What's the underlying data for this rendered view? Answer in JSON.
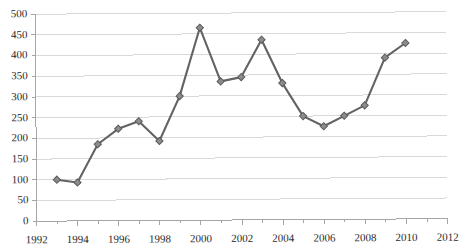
{
  "chart_data": {
    "type": "line",
    "title": "",
    "subtitle": "",
    "xlabel": "",
    "ylabel": "",
    "grid": true,
    "legend": false,
    "legend_position": "none",
    "xlim": [
      1992,
      2012
    ],
    "ylim": [
      0,
      500
    ],
    "x_tick_step": 2,
    "y_tick_step": 50,
    "marker": "diamond",
    "line_color": "#636363",
    "marker_color": "#8c8c8c",
    "marker_edge_color": "#5a5a5a",
    "grid_color": "#d9d9d9",
    "axis_color": "#a6a6a6",
    "x_tick_labels": [
      "1992",
      "1994",
      "1996",
      "1998",
      "2000",
      "2002",
      "2004",
      "2006",
      "2008",
      "2010",
      "2012"
    ],
    "y_tick_labels": [
      "0",
      "50",
      "100",
      "150",
      "200",
      "250",
      "300",
      "350",
      "400",
      "450",
      "500"
    ],
    "x": [
      1993,
      1994,
      1995,
      1996,
      1997,
      1998,
      1999,
      2000,
      2001,
      2002,
      2003,
      2004,
      2005,
      2006,
      2007,
      2008,
      2009,
      2010
    ],
    "values": [
      100,
      93,
      185,
      222,
      240,
      192,
      300,
      465,
      335,
      345,
      435,
      330,
      250,
      225,
      250,
      275,
      390,
      425
    ],
    "series": [
      {
        "name": "Series 1",
        "x": [
          1993,
          1994,
          1995,
          1996,
          1997,
          1998,
          1999,
          2000,
          2001,
          2002,
          2003,
          2004,
          2005,
          2006,
          2007,
          2008,
          2009,
          2010
        ],
        "values": [
          100,
          93,
          185,
          222,
          240,
          192,
          300,
          465,
          335,
          345,
          435,
          330,
          250,
          225,
          250,
          275,
          390,
          425
        ]
      }
    ]
  }
}
